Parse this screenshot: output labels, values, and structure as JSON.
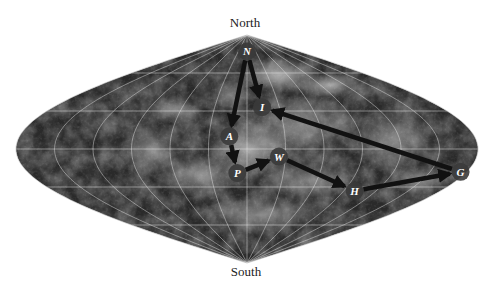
{
  "map": {
    "projection": "sinusoidal",
    "labels": {
      "north": "North",
      "south": "South"
    },
    "graticule": {
      "latitudes_deg": [
        -60,
        -30,
        0,
        30,
        60
      ],
      "longitudes_deg": [
        -150,
        -120,
        -90,
        -60,
        -30,
        0,
        30,
        60,
        90,
        120,
        150
      ]
    },
    "colors": {
      "surface_dark": "#2a2a2a",
      "surface_mid": "#5a5a5a",
      "surface_light": "#a8a8a8",
      "grid": "#e8e8e8",
      "arrow": "#111111",
      "marker_fill": "#3a3a3a",
      "marker_text": "#ffffff"
    },
    "markers": [
      {
        "id": "N",
        "label": "N",
        "lon": 0,
        "lat": 77
      },
      {
        "id": "I",
        "label": "I",
        "lon": 14,
        "lat": 33
      },
      {
        "id": "A",
        "label": "A",
        "lon": -14,
        "lat": 10
      },
      {
        "id": "P",
        "label": "P",
        "lon": -8,
        "lat": -19
      },
      {
        "id": "W",
        "label": "W",
        "lon": 25,
        "lat": -6
      },
      {
        "id": "H",
        "label": "H",
        "lon": 100,
        "lat": -33
      },
      {
        "id": "G",
        "label": "G",
        "lon": 175,
        "lat": -18
      }
    ],
    "route": [
      [
        "N",
        "I"
      ],
      [
        "N",
        "A"
      ],
      [
        "A",
        "P"
      ],
      [
        "P",
        "W"
      ],
      [
        "W",
        "H"
      ],
      [
        "H",
        "G"
      ],
      [
        "G",
        "I"
      ]
    ]
  }
}
